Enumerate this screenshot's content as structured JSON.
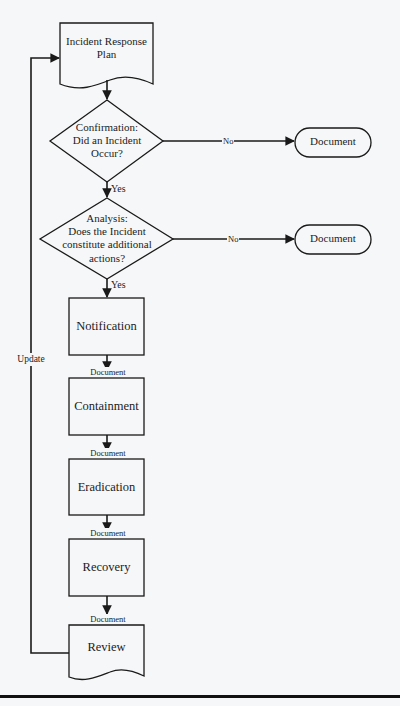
{
  "diagram": {
    "colors": {
      "background": "#f6f7f8",
      "stroke": "#1a1a1a",
      "text": "#1c1c1c"
    },
    "nodes": {
      "plan": {
        "type": "document",
        "label_line1": "Incident Response",
        "label_line2": "Plan"
      },
      "confirmation": {
        "type": "decision",
        "line1": "Confirmation:",
        "line2": "Did an Incident",
        "line3": "Occur?"
      },
      "analysis": {
        "type": "decision",
        "line1": "Analysis:",
        "line2": "Does the Incident",
        "line3": "constitute additional",
        "line4": "actions?"
      },
      "document_1": {
        "type": "terminator",
        "label": "Document"
      },
      "document_2": {
        "type": "terminator",
        "label": "Document"
      },
      "notification": {
        "type": "process",
        "label": "Notification"
      },
      "containment": {
        "type": "process",
        "label": "Containment"
      },
      "eradication": {
        "type": "process",
        "label": "Eradication"
      },
      "recovery": {
        "type": "process",
        "label": "Recovery"
      },
      "review": {
        "type": "document",
        "label": "Review"
      }
    },
    "edges": {
      "confirmation_no": "No",
      "confirmation_yes": "Yes",
      "analysis_no": "No",
      "analysis_yes": "Yes",
      "notification_to_containment": "Document",
      "containment_to_eradication": "Document",
      "eradication_to_recovery": "Document",
      "recovery_to_review": "Document",
      "review_to_plan": "Update"
    }
  }
}
